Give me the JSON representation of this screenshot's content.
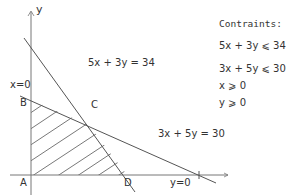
{
  "diagram": {
    "type": "linear-programming-feasible-region",
    "axes": {
      "x_label": "y=0",
      "y_label": "y",
      "y_axis_label": "x=0"
    },
    "points": {
      "A": "A",
      "B": "B",
      "C": "C",
      "D": "D"
    },
    "lines": [
      {
        "id": "line1",
        "equation": "5x + 3y = 34"
      },
      {
        "id": "line2",
        "equation": "3x + 5y = 30"
      }
    ],
    "feasible_region": {
      "vertices": [
        "A",
        "B",
        "C",
        "D"
      ],
      "fill": "hatched"
    }
  },
  "constraints": {
    "title": "Contraints:",
    "items": [
      "5x + 3y ⩽ 34",
      "3x + 5y ⩽ 30",
      "x ⩾ 0",
      "y ⩾ 0"
    ]
  },
  "colors": {
    "line": "#555555",
    "axis": "#777777",
    "text": "#333333"
  }
}
